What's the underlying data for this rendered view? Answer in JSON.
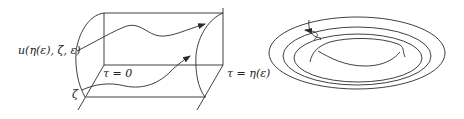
{
  "figure": {
    "left_panel": {
      "labels": {
        "solution": "u(η(ε), ζ, ε)",
        "initial_point": "ζ",
        "tau_start": "τ = 0",
        "tau_end": "τ = η(ε)"
      },
      "description": "Cylinder-like flow tube with two trajectories flowing from the τ = 0 plane to the τ = η(ε) surface"
    },
    "right_panel": {
      "description": "Nested closed orbits (concentric ovals) with a trajectory spiraling inward",
      "ring_count": 4
    },
    "colors": {
      "stroke": "#2a2a2a",
      "background": "#ffffff"
    }
  }
}
